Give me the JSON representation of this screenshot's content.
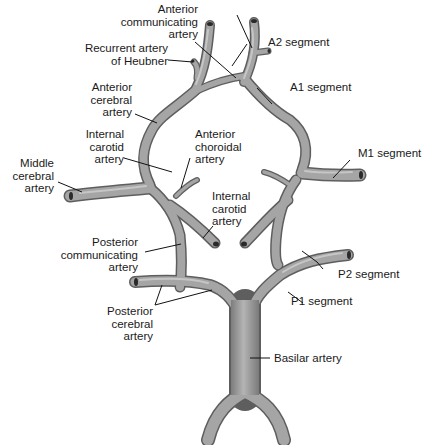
{
  "diagram": {
    "vessel_color": "#9a9a9a",
    "vessel_edge_color": "#555555",
    "leader_color": "#111111"
  },
  "labels": {
    "anterior_communicating": "Anterior\ncommunicating\nartery",
    "recurrent_heubner": "Recurrent artery\nof Heubner",
    "a2_segment": "A2 segment",
    "a1_segment": "A1 segment",
    "anterior_cerebral": "Anterior\ncerebral\nartery",
    "internal_carotid_left": "Internal\ncarotid\nartery",
    "anterior_choroidal": "Anterior\nchoroidal\nartery",
    "middle_cerebral": "Middle\ncerebral\nartery",
    "m1_segment": "M1 segment",
    "internal_carotid_center": "Internal\ncarotid\nartery",
    "posterior_communicating": "Posterior\ncommunicating\nartery",
    "p2_segment": "P2 segment",
    "p1_segment": "P1 segment",
    "posterior_cerebral": "Posterior\ncerebral\nartery",
    "basilar": "Basilar artery"
  }
}
